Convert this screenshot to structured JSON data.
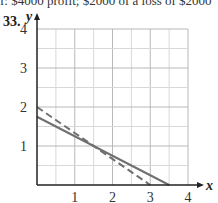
{
  "top_text": "f: $4000 profit;    $2000 of a loss of $2000",
  "problem_number": "33.",
  "chart_data": {
    "type": "line",
    "title": "",
    "xlabel": "x",
    "ylabel": "y",
    "xlim": [
      0,
      4
    ],
    "ylim": [
      0,
      4
    ],
    "x_ticks": [
      "1",
      "2",
      "3",
      "4"
    ],
    "y_ticks": [
      "1",
      "2",
      "3",
      "4"
    ],
    "grid": true,
    "grid_step": 0.5,
    "series": [
      {
        "name": "solid line",
        "style": "solid",
        "points": [
          [
            0,
            1.75
          ],
          [
            3.5,
            0
          ]
        ]
      },
      {
        "name": "dashed line",
        "style": "dashed",
        "points": [
          [
            0,
            2
          ],
          [
            3,
            0
          ]
        ]
      }
    ],
    "intersection": [
      1.5,
      1
    ]
  },
  "colors": {
    "grid": "#c8c8c8",
    "axis": "#222222",
    "line": "#707070"
  }
}
